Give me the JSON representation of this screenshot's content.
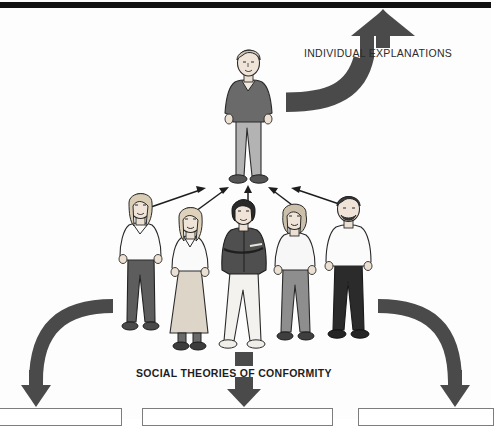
{
  "diagram": {
    "type": "conceptual-flow-diagram",
    "labels": {
      "individual": "INDIVIDUAL EXPLANATIONS",
      "social": "SOCIAL THEORIES OF CONFORMITY"
    },
    "colors": {
      "arrow": "#4a4a4a",
      "topbar": "#111111",
      "ink": "#1a1a1a",
      "skin": "#f0e4d8",
      "paper": "#fdfdfd",
      "box_border": "#7d7d7d"
    },
    "top_figure": {
      "name": "lone-individual",
      "hair": "#cfc4b2",
      "top": "#6a6a6a",
      "legs": "#b3b3b3",
      "shoes": "#555555"
    },
    "group": [
      {
        "name": "group-figure-1",
        "hair": "#d9cdb6",
        "top": "#fbfbfb",
        "legs": "#5d5d5d",
        "shoes": "#4a4a4a"
      },
      {
        "name": "group-figure-2",
        "hair": "#ded2bb",
        "top": "#fafafa",
        "legs": "#ddd5c8",
        "shoes": "#3c3c3c"
      },
      {
        "name": "group-figure-3",
        "hair": "#2a2a2a",
        "top": "#4f4f4f",
        "legs": "#f4f2ee",
        "shoes": "#f0eee9"
      },
      {
        "name": "group-figure-4",
        "hair": "#ccc0ab",
        "top": "#f7f7f7",
        "legs": "#8e8e8e",
        "shoes": "#3f3f3f"
      },
      {
        "name": "group-figure-5",
        "hair": "#3a3a3a",
        "top": "#fbfbfb",
        "legs": "#2b2b2b",
        "shoes": "#242424"
      }
    ],
    "converging_arrows": 5,
    "bottom_boxes": [
      {
        "name": "outcome-box-1",
        "text": ""
      },
      {
        "name": "outcome-box-2",
        "text": ""
      },
      {
        "name": "outcome-box-3",
        "text": ""
      }
    ]
  }
}
